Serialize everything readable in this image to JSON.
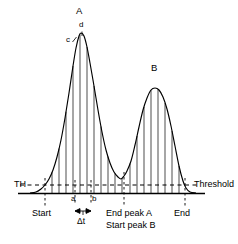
{
  "figure": {
    "background": "#ffffff",
    "ink": "#000000",
    "width": 238,
    "height": 244
  },
  "axes": {
    "baseline_y": 193,
    "threshold_y": 185,
    "baseline_x_start": 18,
    "baseline_x_end": 205
  },
  "labels": {
    "threshold_left": "TH",
    "threshold_right": "Threshold",
    "peak_a": "A",
    "peak_b": "B",
    "point_c": "c",
    "point_d": "d",
    "point_a": "a",
    "point_b": "b",
    "delta_t": "Δt",
    "start": "Start",
    "end_peak_a": "End peak A",
    "start_peak_b": "Start peak B",
    "end": "End"
  },
  "markers": [
    {
      "name": "start",
      "x": 45,
      "label": "Start"
    },
    {
      "name": "point-a",
      "x": 75,
      "label": "a"
    },
    {
      "name": "point-b",
      "x": 91,
      "label": "b"
    },
    {
      "name": "end-peak-a",
      "x": 124,
      "label": "End peak A"
    },
    {
      "name": "start-peak-b",
      "x": 124,
      "label": "Start peak B"
    },
    {
      "name": "end",
      "x": 185,
      "label": "End"
    }
  ],
  "chart_data": {
    "type": "line",
    "title": "",
    "xlabel": "",
    "ylabel": "",
    "grid": false,
    "legend": "none",
    "threshold": {
      "value": 185,
      "style": "dashed",
      "left_label": "TH",
      "right_label": "Threshold"
    },
    "peaks": [
      {
        "name": "A",
        "apex_x": 80,
        "apex_y": 33,
        "start_x": 45,
        "end_x": 124
      },
      {
        "name": "B",
        "apex_x": 155,
        "apex_y": 88,
        "start_x": 124,
        "end_x": 185
      }
    ],
    "valley": {
      "x": 124,
      "y": 176
    },
    "annotations": [
      {
        "text": "c",
        "x": 70,
        "y": 40
      },
      {
        "text": "d",
        "x": 82,
        "y": 26
      },
      {
        "text": "a",
        "x": 75,
        "y": 198
      },
      {
        "text": "b",
        "x": 91,
        "y": 198
      },
      {
        "text": "Δt",
        "x": 83,
        "y": 222
      }
    ],
    "sample_lines_x": [
      52,
      59,
      66,
      73,
      80,
      87,
      94,
      101,
      108,
      115,
      122,
      130,
      137,
      144,
      151,
      158,
      165,
      172,
      179
    ],
    "curve_points": [
      [
        30,
        193
      ],
      [
        36,
        192
      ],
      [
        41,
        189
      ],
      [
        45,
        185
      ],
      [
        49,
        179
      ],
      [
        53,
        170
      ],
      [
        57,
        157
      ],
      [
        61,
        140
      ],
      [
        65,
        118
      ],
      [
        69,
        93
      ],
      [
        73,
        66
      ],
      [
        76,
        48
      ],
      [
        79,
        36
      ],
      [
        81,
        33
      ],
      [
        84,
        36
      ],
      [
        87,
        47
      ],
      [
        90,
        63
      ],
      [
        94,
        86
      ],
      [
        98,
        110
      ],
      [
        102,
        132
      ],
      [
        106,
        150
      ],
      [
        110,
        163
      ],
      [
        114,
        172
      ],
      [
        118,
        177
      ],
      [
        121,
        179
      ],
      [
        124,
        176
      ],
      [
        127,
        171
      ],
      [
        131,
        161
      ],
      [
        135,
        145
      ],
      [
        139,
        127
      ],
      [
        143,
        110
      ],
      [
        147,
        98
      ],
      [
        151,
        90
      ],
      [
        155,
        88
      ],
      [
        159,
        90
      ],
      [
        163,
        97
      ],
      [
        167,
        109
      ],
      [
        171,
        126
      ],
      [
        175,
        146
      ],
      [
        179,
        166
      ],
      [
        183,
        181
      ],
      [
        186,
        188
      ],
      [
        190,
        192
      ],
      [
        196,
        193
      ]
    ]
  }
}
